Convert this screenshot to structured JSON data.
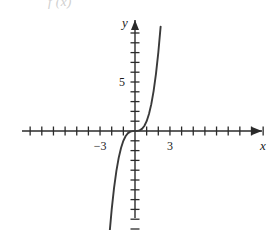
{
  "figure": {
    "cut_off_text": "f (x)",
    "axis_labels": {
      "x": "x",
      "y": "y"
    },
    "stroke_color": "#3a3a3a",
    "axis_color": "#2b2b2b"
  },
  "chart_data": {
    "type": "line",
    "title": "",
    "subtitle": "",
    "xlabel": "x",
    "ylabel": "y",
    "function": "y = x^3",
    "grid": false,
    "legend": null,
    "xlim": [
      -9.7,
      11.6
    ],
    "ylim": [
      -11.3,
      11.3
    ],
    "xticks": [
      -9,
      -8,
      -7,
      -6,
      -5,
      -4,
      -3,
      -2,
      -1,
      1,
      2,
      3,
      4,
      5,
      6,
      7,
      8,
      9,
      10,
      11
    ],
    "yticks": [
      -11,
      -10,
      -9,
      -8,
      -7,
      -6,
      -5,
      -4,
      -3,
      -2,
      -1,
      1,
      2,
      3,
      4,
      5,
      6,
      7,
      8,
      9,
      10
    ],
    "xtick_labels": [
      {
        "value": -3,
        "label": "-3"
      },
      {
        "value": 3,
        "label": "3"
      }
    ],
    "ytick_labels": [
      {
        "value": 5,
        "label": "5"
      }
    ],
    "series": [
      {
        "name": "y = x^3",
        "x": [
          -2.2,
          -2.0,
          -1.8,
          -1.6,
          -1.4,
          -1.2,
          -1.0,
          -0.8,
          -0.6,
          -0.4,
          -0.2,
          0.0,
          0.2,
          0.4,
          0.6,
          0.8,
          1.0,
          1.2,
          1.4,
          1.6,
          1.8,
          2.0,
          2.2
        ],
        "values": [
          -10.65,
          -8.0,
          -5.83,
          -4.1,
          -2.74,
          -1.73,
          -1.0,
          -0.51,
          -0.22,
          -0.06,
          -0.01,
          0.0,
          0.01,
          0.06,
          0.22,
          0.51,
          1.0,
          1.73,
          2.74,
          4.1,
          5.83,
          8.0,
          10.65
        ]
      }
    ]
  }
}
